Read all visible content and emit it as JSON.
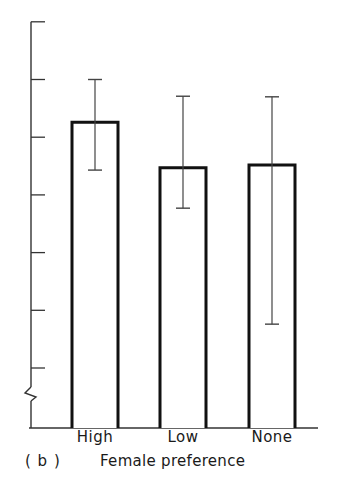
{
  "chart_data": {
    "type": "bar",
    "title": "",
    "panel_label": "( b )",
    "xlabel": "Female preference",
    "ylabel": "",
    "categories": [
      "High",
      "Low",
      "None"
    ],
    "values": [
      5.26,
      4.47,
      4.52
    ],
    "error_bars": [
      {
        "category": "High",
        "lower": 4.43,
        "upper": 6.0
      },
      {
        "category": "Low",
        "lower": 3.77,
        "upper": 5.71
      },
      {
        "category": "None",
        "lower": 1.76,
        "upper": 5.7
      }
    ],
    "value_units": "y-axis tick intervals above first labelled tick (no numeric tick labels shown)",
    "y_ticks_count": 7,
    "y_axis_break": true,
    "ylim": [
      0,
      7
    ],
    "grid": false,
    "legend": null,
    "bar_style": {
      "fill": "#ffffff",
      "stroke": "#111111"
    }
  },
  "layout": {
    "axis_color": "#333333",
    "bar_stroke": "#111111",
    "errorbar_color": "#444444"
  }
}
